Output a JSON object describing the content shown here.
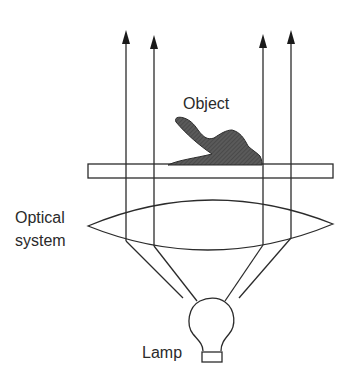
{
  "diagram": {
    "labels": {
      "object": "Object",
      "optical_line1": "Optical",
      "optical_line2": "system",
      "lamp": "Lamp"
    },
    "components": [
      "lamp",
      "optical-system-lens",
      "specimen-slide",
      "object",
      "light-rays"
    ],
    "colors": {
      "line": "#2b2b2b",
      "object_fill": "#555555",
      "background": "#ffffff"
    }
  }
}
